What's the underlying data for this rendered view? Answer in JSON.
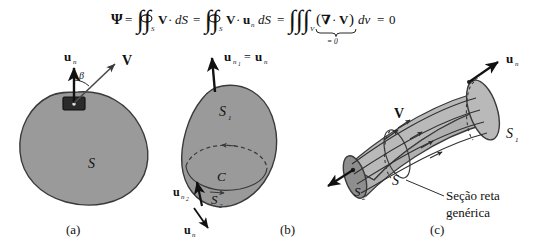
{
  "figure": {
    "caption_panels": [
      "(a)",
      "(b)",
      "(c)"
    ],
    "language": "pt-BR",
    "background_color": "#ffffff",
    "ink_color": "#111111"
  },
  "equation": {
    "full_text": "Ψ = ∯_S V·dS = ∯_S V·u_n dS = ∭_V (∇·V) dv = 0",
    "psi": "Ψ",
    "eq1": "=",
    "surf_int_1": "∯",
    "sub_S_1": "S",
    "V_1": "V",
    "dot_1": "·",
    "dS_1": "dS",
    "eq2": "=",
    "surf_int_2": "∯",
    "sub_S_2": "S",
    "V_2": "V",
    "dot_2": "·",
    "u_2": "u",
    "u_sub_2": "n",
    "dS_2": "dS",
    "eq3": "=",
    "vol_int": "∭",
    "sub_V": "V",
    "paren_open": "(",
    "nabla": "∇",
    "dot_3": "·",
    "V_3": "V",
    "paren_close": ")",
    "dv": "dv",
    "eq4": "=",
    "zero": "0",
    "underbrace_label": "= 0"
  },
  "panel_a": {
    "label": "(a)",
    "surface_label": "S",
    "normal_label": "u",
    "normal_sub": "n",
    "velocity_label": "V",
    "angle_label": "β",
    "blob_fill": "#9a9a9a",
    "blob_stroke": "#3a3a3a",
    "patch_fill": "#2b2b2b",
    "description": "Closed surface S with differential area patch dS, unit normal u_n and velocity V at angle beta"
  },
  "panel_b": {
    "label": "(b)",
    "top_normal_label": "u",
    "top_normal_sub": "n",
    "top_normal_subsub": "1",
    "top_equals": "=",
    "top_normal_label2": "u",
    "top_normal_sub2": "n",
    "surface_1": "S",
    "surface_1_sub": "1",
    "surface_2": "S",
    "surface_2_sub": "2",
    "curve_label": "C",
    "normal_2_label": "u",
    "normal_2_sub": "n",
    "normal_2_subsub": "2",
    "bottom_normal_label": "u",
    "bottom_normal_sub": "n",
    "blob_fill": "#9a9a9a",
    "blob_stroke": "#3a3a3a",
    "description": "Closed surface split by contour C into upper cap S1 and lower cap S2 with their outward normals"
  },
  "panel_c": {
    "label": "(c)",
    "velocity_label": "V",
    "surface_1": "S",
    "surface_1_sub": "1",
    "surface_2": "S",
    "surface_2_sub": "2",
    "surface_mid": "S",
    "normal_right_label": "u",
    "normal_right_sub": "n",
    "normal_left_label": "u",
    "normal_left_sub": "n",
    "annotation_line1": "Seção reta",
    "annotation_line2": "genérica",
    "tube_fill": "#b9b9b9",
    "cap_fill": "#8e8e8e",
    "tube_stroke": "#3a3a3a",
    "description": "Stream tube bounded by S1 and S2 end caps with generic cross-section S and streamlines V"
  }
}
